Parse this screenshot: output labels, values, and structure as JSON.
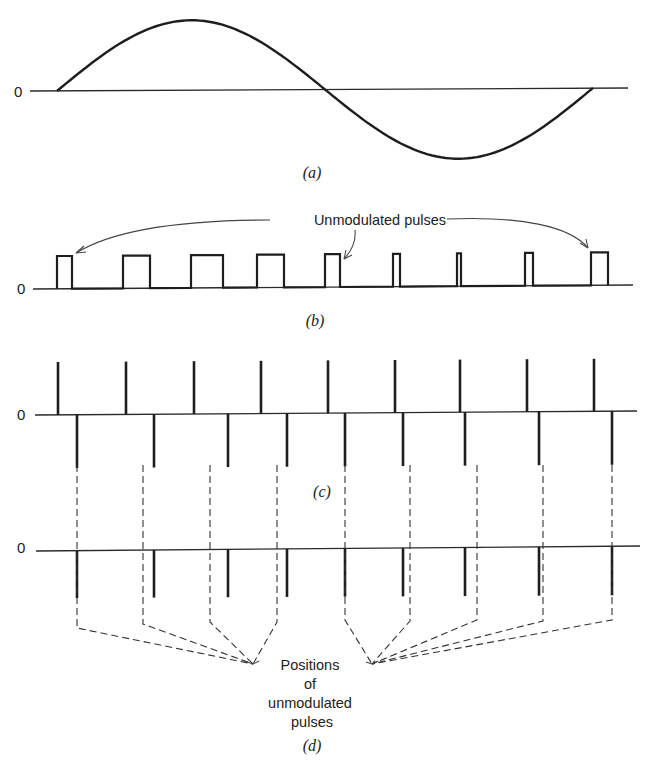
{
  "figure": {
    "panels": [
      {
        "id": "a",
        "caption": "(a)",
        "zero_label": "0",
        "type": "sine-wave",
        "axis_y": 91,
        "period_start_x": 57,
        "period_end_x": 593,
        "amplitude_px": 70
      },
      {
        "id": "b",
        "caption": "(b)",
        "zero_label": "0",
        "type": "pulse-width-modulation",
        "axis_y": 288,
        "pulse_top_y": 256,
        "annotation": "Unmodulated pulses",
        "pulses": [
          {
            "x": 57,
            "w": 15
          },
          {
            "x": 123,
            "w": 27
          },
          {
            "x": 191,
            "w": 32
          },
          {
            "x": 257,
            "w": 27
          },
          {
            "x": 325,
            "w": 15
          },
          {
            "x": 393,
            "w": 7
          },
          {
            "x": 457,
            "w": 4
          },
          {
            "x": 525,
            "w": 8
          },
          {
            "x": 591,
            "w": 17
          }
        ]
      },
      {
        "id": "c",
        "caption": "(c)",
        "zero_label": "0",
        "type": "differentiated-pulses",
        "axis_y": 414,
        "positive_spikes_x": [
          58,
          126,
          194,
          261,
          328,
          395,
          460,
          527,
          594
        ],
        "negative_spikes_x": [
          77,
          154,
          228,
          287,
          345,
          403,
          465,
          539,
          612
        ],
        "spike_up_y": 362,
        "spike_down_y": 468
      },
      {
        "id": "d",
        "caption": "(d)",
        "zero_label": "0",
        "type": "pulse-position-modulation",
        "axis_y": 547,
        "spikes_x": [
          77,
          154,
          228,
          287,
          345,
          403,
          465,
          539,
          612
        ],
        "spike_down_y": 598,
        "unmodulated_positions_x": [
          77,
          143,
          210,
          277,
          345,
          410,
          477,
          543,
          612
        ],
        "annotation_lines": [
          "Positions",
          "of",
          "unmodulated",
          "pulses"
        ],
        "convergence_points": [
          [
            253,
            664
          ],
          [
            372,
            664
          ]
        ]
      }
    ]
  }
}
